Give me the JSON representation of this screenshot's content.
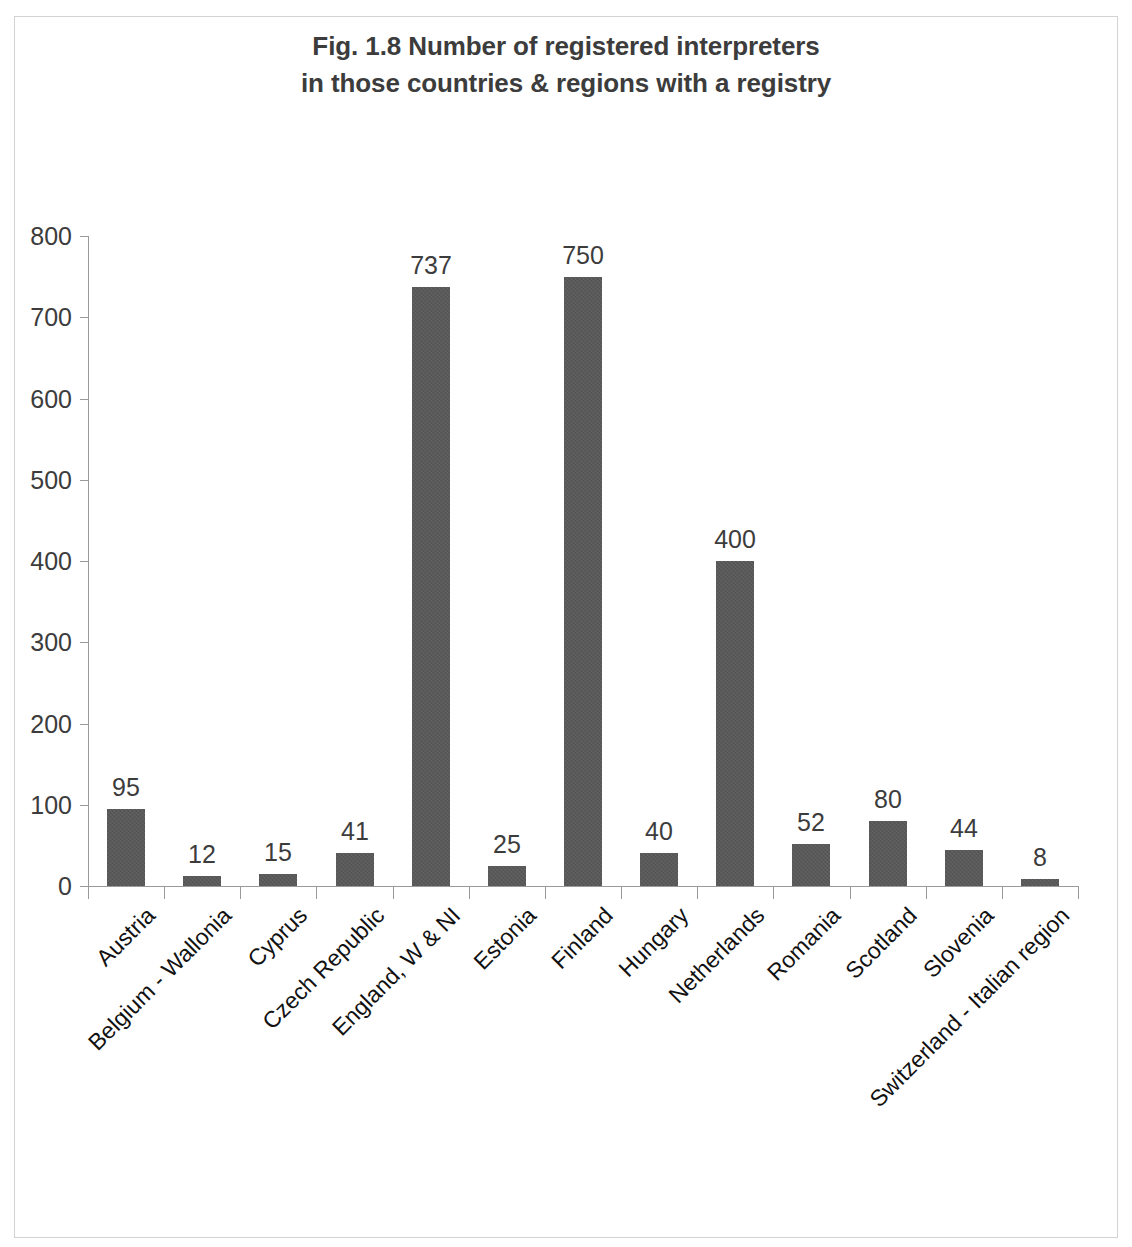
{
  "chart_data": {
    "type": "bar",
    "title": "Fig. 1.8 Number of registered interpreters in those countries & regions with a registry",
    "title_lines": [
      "Fig. 1.8 Number of registered interpreters",
      "in those countries & regions with a registry"
    ],
    "xlabel": "",
    "ylabel": "",
    "ylim": [
      0,
      800
    ],
    "ytick_step": 100,
    "yticks": [
      "800",
      "700",
      "600",
      "500",
      "400",
      "300",
      "200",
      "100",
      "0"
    ],
    "ytick_values": [
      800,
      700,
      600,
      500,
      400,
      300,
      200,
      100,
      0
    ],
    "grid": false,
    "legend": false,
    "bar_color": "#585858",
    "axis_color": "#9a9a9a",
    "text_color": "#3c3c3c",
    "categories": [
      "Austria",
      "Belgium - Wallonia",
      "Cyprus",
      "Czech Republic",
      "England, W & NI",
      "Estonia",
      "Finland",
      "Hungary",
      "Netherlands",
      "Romania",
      "Scotland",
      "Slovenia",
      "Switzerland - Italian region"
    ],
    "values": [
      95,
      12,
      15,
      41,
      737,
      25,
      750,
      40,
      400,
      52,
      80,
      44,
      8
    ],
    "data_labels": [
      "95",
      "12",
      "15",
      "41",
      "737",
      "25",
      "750",
      "40",
      "400",
      "52",
      "80",
      "44",
      "8"
    ]
  }
}
